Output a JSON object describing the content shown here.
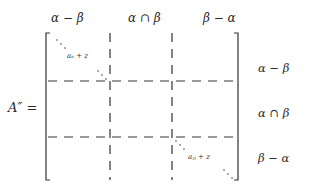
{
  "matrix": {
    "lhs": "A″ =",
    "column_headers": [
      "α − β",
      "α ∩ β",
      "β − α"
    ],
    "row_labels": [
      "α − β",
      "α ∩ β",
      "β − α"
    ],
    "diagonal_entries": [
      "a_ii + z",
      "a_jj + z"
    ],
    "diagonal_entry_1": "aᵢᵢ + z",
    "diagonal_entry_2": "aⱼⱼ + z"
  }
}
